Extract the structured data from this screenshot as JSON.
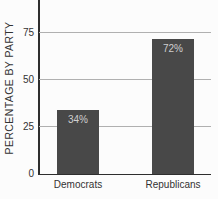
{
  "chart_data": {
    "type": "bar",
    "categories": [
      "Democrats",
      "Republicans"
    ],
    "values": [
      34,
      72
    ],
    "value_labels": [
      "34%",
      "72%"
    ],
    "title": "",
    "xlabel": "",
    "ylabel": "PERCENTAGE BY PARTY",
    "yticks": [
      0,
      25,
      50,
      75
    ],
    "ylim": [
      0,
      100
    ],
    "grid": true,
    "legend": false,
    "colors": {
      "bar": "#484848",
      "bar_label": "#cfcfcf",
      "axis": "#2e2e2e",
      "gridline": "#b0b0b0",
      "tick_label": "#333333",
      "background": "#fcfcfc"
    }
  }
}
